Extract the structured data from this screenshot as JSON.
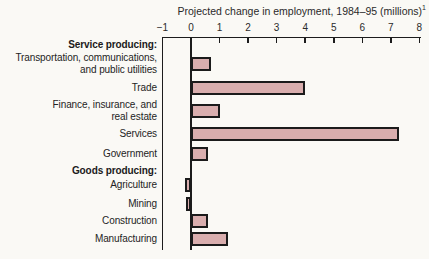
{
  "title": {
    "text": "Projected change in employment, 1984–95 (millions)",
    "footnote_marker": "1"
  },
  "chart_data": {
    "type": "bar",
    "orientation": "horizontal",
    "title": "Projected change in employment, 1984–95 (millions)",
    "xlabel": "",
    "ylabel": "",
    "axis": {
      "min": -1,
      "max": 8,
      "ticks": [
        -1,
        0,
        1,
        2,
        3,
        4,
        5,
        6,
        7,
        8
      ]
    },
    "grid": "none",
    "legend": "none",
    "rows": [
      {
        "label": "Service producing:",
        "header": true,
        "value": null
      },
      {
        "label": "Transportation, communications, and public utilities",
        "label_lines": [
          "Transportation, communications,",
          "and public utilities"
        ],
        "header": false,
        "value": 0.7
      },
      {
        "label": "Trade",
        "header": false,
        "value": 4.0
      },
      {
        "label": "Finance, insurance, and real estate",
        "label_lines": [
          "Finance, insurance, and",
          "real estate"
        ],
        "header": false,
        "value": 1.0
      },
      {
        "label": "Services",
        "header": false,
        "value": 7.3
      },
      {
        "label": "Government",
        "header": false,
        "value": 0.6
      },
      {
        "label": "Goods producing:",
        "header": true,
        "value": null
      },
      {
        "label": "Agriculture",
        "header": false,
        "value": -0.2
      },
      {
        "label": "Mining",
        "header": false,
        "value": -0.1
      },
      {
        "label": "Construction",
        "header": false,
        "value": 0.6
      },
      {
        "label": "Manufacturing",
        "header": false,
        "value": 1.3
      }
    ],
    "colors": {
      "bar_fill": "#d9aeae",
      "bar_border": "#1b1b1b",
      "axis": "#1c1c1c",
      "text": "#242424",
      "background": "#faf9f5"
    }
  }
}
